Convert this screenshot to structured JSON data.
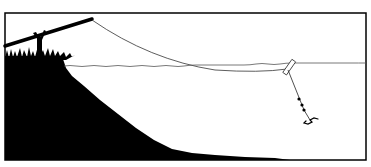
{
  "illustration": {
    "subject": "fishing line from bank into water with float and hook",
    "colors": {
      "background": "#ffffff",
      "ink": "#000000",
      "line": "#333333",
      "water_line": "#555555"
    },
    "elements": [
      "frame-border",
      "river-bank",
      "grass",
      "rod-rest-stick",
      "fishing-rod",
      "fishing-line",
      "water-surface",
      "float",
      "split-shot-weights",
      "hook"
    ]
  }
}
